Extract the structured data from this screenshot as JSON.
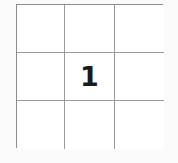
{
  "puzzle": {
    "type": "sudoku-grid-3x3",
    "rows": 3,
    "columns": 3,
    "background_color": "#fbfbfb",
    "cell_background_color": "#ffffff",
    "grid_line_color": "#9a9a9a",
    "border_color": "#8d8d8d",
    "digit_color": "#1a1a1a",
    "cells": [
      {
        "row": 1,
        "col": 1,
        "value": ""
      },
      {
        "row": 1,
        "col": 2,
        "value": ""
      },
      {
        "row": 1,
        "col": 3,
        "value": ""
      },
      {
        "row": 2,
        "col": 1,
        "value": ""
      },
      {
        "row": 2,
        "col": 2,
        "value": "1"
      },
      {
        "row": 2,
        "col": 3,
        "value": ""
      },
      {
        "row": 3,
        "col": 1,
        "value": ""
      },
      {
        "row": 3,
        "col": 2,
        "value": ""
      },
      {
        "row": 3,
        "col": 3,
        "value": ""
      }
    ]
  }
}
